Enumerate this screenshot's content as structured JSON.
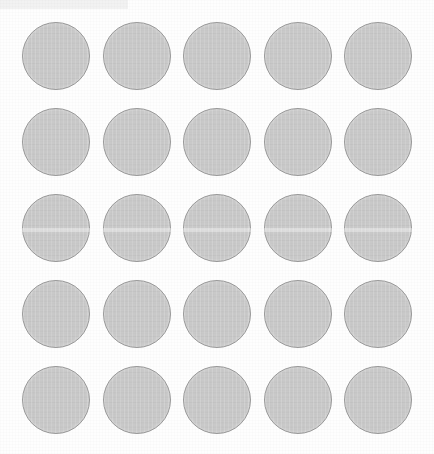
{
  "scene": {
    "title": "Circle Grid Scan Sheet",
    "description": "Scanned sheet showing a 5 by 5 grid of uniform light gray circular discs on white paper",
    "background_color": "#fefefe",
    "width": 434,
    "height": 454
  },
  "grid": {
    "rows": 5,
    "columns": 5,
    "total_items": 25,
    "disc_diameter": 68,
    "column_pitch": 80.5,
    "row_pitch": 86,
    "origin_x": 22,
    "origin_y": 22,
    "disc_fill_color": "#c9c9c9",
    "disc_border_color": "#9a9a9a",
    "row_labels": [
      "Row 1",
      "Row 2",
      "Row 3",
      "Row 4",
      "Row 5"
    ],
    "column_labels": [
      "Column 1",
      "Column 2",
      "Column 3",
      "Column 4",
      "Column 5"
    ],
    "column_x": [
      22,
      102.5,
      183,
      263.5,
      344
    ],
    "row_y": [
      22,
      108,
      194,
      280,
      366
    ],
    "discs": [
      {
        "id": "disc-r1c1",
        "row": 1,
        "col": 1,
        "x": 22,
        "y": 22,
        "d": 68
      },
      {
        "id": "disc-r1c2",
        "row": 1,
        "col": 2,
        "x": 102.5,
        "y": 22,
        "d": 68
      },
      {
        "id": "disc-r1c3",
        "row": 1,
        "col": 3,
        "x": 183,
        "y": 22,
        "d": 68
      },
      {
        "id": "disc-r1c4",
        "row": 1,
        "col": 4,
        "x": 263.5,
        "y": 22,
        "d": 68
      },
      {
        "id": "disc-r1c5",
        "row": 1,
        "col": 5,
        "x": 344,
        "y": 22,
        "d": 68
      },
      {
        "id": "disc-r2c1",
        "row": 2,
        "col": 1,
        "x": 22,
        "y": 108,
        "d": 68
      },
      {
        "id": "disc-r2c2",
        "row": 2,
        "col": 2,
        "x": 102.5,
        "y": 108,
        "d": 68
      },
      {
        "id": "disc-r2c3",
        "row": 2,
        "col": 3,
        "x": 183,
        "y": 108,
        "d": 68
      },
      {
        "id": "disc-r2c4",
        "row": 2,
        "col": 4,
        "x": 263.5,
        "y": 108,
        "d": 68
      },
      {
        "id": "disc-r2c5",
        "row": 2,
        "col": 5,
        "x": 344,
        "y": 108,
        "d": 68
      },
      {
        "id": "disc-r3c1",
        "row": 3,
        "col": 1,
        "x": 22,
        "y": 194,
        "d": 68
      },
      {
        "id": "disc-r3c2",
        "row": 3,
        "col": 2,
        "x": 102.5,
        "y": 194,
        "d": 68
      },
      {
        "id": "disc-r3c3",
        "row": 3,
        "col": 3,
        "x": 183,
        "y": 194,
        "d": 68
      },
      {
        "id": "disc-r3c4",
        "row": 3,
        "col": 4,
        "x": 263.5,
        "y": 194,
        "d": 68
      },
      {
        "id": "disc-r3c5",
        "row": 3,
        "col": 5,
        "x": 344,
        "y": 194,
        "d": 68
      },
      {
        "id": "disc-r4c1",
        "row": 4,
        "col": 1,
        "x": 22,
        "y": 280,
        "d": 68
      },
      {
        "id": "disc-r4c2",
        "row": 4,
        "col": 2,
        "x": 102.5,
        "y": 280,
        "d": 68
      },
      {
        "id": "disc-r4c3",
        "row": 4,
        "col": 3,
        "x": 183,
        "y": 280,
        "d": 68
      },
      {
        "id": "disc-r4c4",
        "row": 4,
        "col": 4,
        "x": 263.5,
        "y": 280,
        "d": 68
      },
      {
        "id": "disc-r4c5",
        "row": 4,
        "col": 5,
        "x": 344,
        "y": 280,
        "d": 68
      },
      {
        "id": "disc-r5c1",
        "row": 5,
        "col": 1,
        "x": 22,
        "y": 366,
        "d": 68
      },
      {
        "id": "disc-r5c2",
        "row": 5,
        "col": 2,
        "x": 102.5,
        "y": 366,
        "d": 68
      },
      {
        "id": "disc-r5c3",
        "row": 5,
        "col": 3,
        "x": 183,
        "y": 366,
        "d": 68
      },
      {
        "id": "disc-r5c4",
        "row": 5,
        "col": 4,
        "x": 263.5,
        "y": 366,
        "d": 68
      },
      {
        "id": "disc-r5c5",
        "row": 5,
        "col": 5,
        "x": 344,
        "y": 366,
        "d": 68
      }
    ]
  },
  "artifacts": {
    "scan_streak": {
      "name": "horizontal-scan-streak",
      "y": 228,
      "height": 4,
      "color": "rgba(255,255,255,0.40)"
    },
    "corner_band": {
      "name": "top-left-gray-band",
      "x": 0,
      "y": 0,
      "width": 128,
      "height": 9,
      "color": "#f2f2f2"
    }
  }
}
